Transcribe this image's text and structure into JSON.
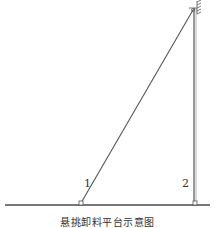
{
  "diagram": {
    "caption": "悬挑卸料平台示意图",
    "labels": {
      "cable_1": "1",
      "cable_2": "2"
    },
    "colors": {
      "line": "#555555",
      "ground": "#777777",
      "background": "#ffffff"
    }
  }
}
